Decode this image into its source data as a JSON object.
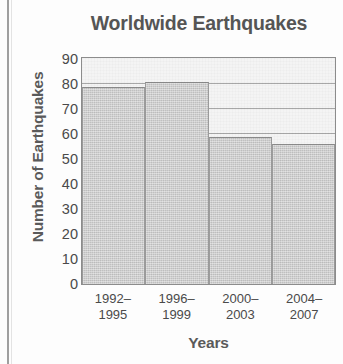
{
  "chart_data": {
    "type": "bar",
    "title": "Worldwide Earthquakes",
    "xlabel": "Years",
    "ylabel": "Number of Earthquakes",
    "categories": [
      "1992–1995",
      "1996–1999",
      "2000–2003",
      "2004–2007"
    ],
    "category_lines": [
      [
        "1992–",
        "1995"
      ],
      [
        "1996–",
        "1999"
      ],
      [
        "2000–",
        "2003"
      ],
      [
        "2004–",
        "2007"
      ]
    ],
    "values": [
      79,
      81,
      59,
      56
    ],
    "ylim": [
      0,
      90
    ],
    "ytick_step": 10,
    "yticks": [
      90,
      80,
      70,
      60,
      50,
      40,
      30,
      20,
      10,
      0
    ],
    "grid": true,
    "legend": "none",
    "colors": {
      "bar_fill": "#c9c9c9",
      "bar_edge": "#8a8a8a",
      "plot_background": "#f4f4f4",
      "gridline": "#9a9a9a",
      "title_text": "#555555",
      "axis_text": "#4a4a4a"
    }
  }
}
